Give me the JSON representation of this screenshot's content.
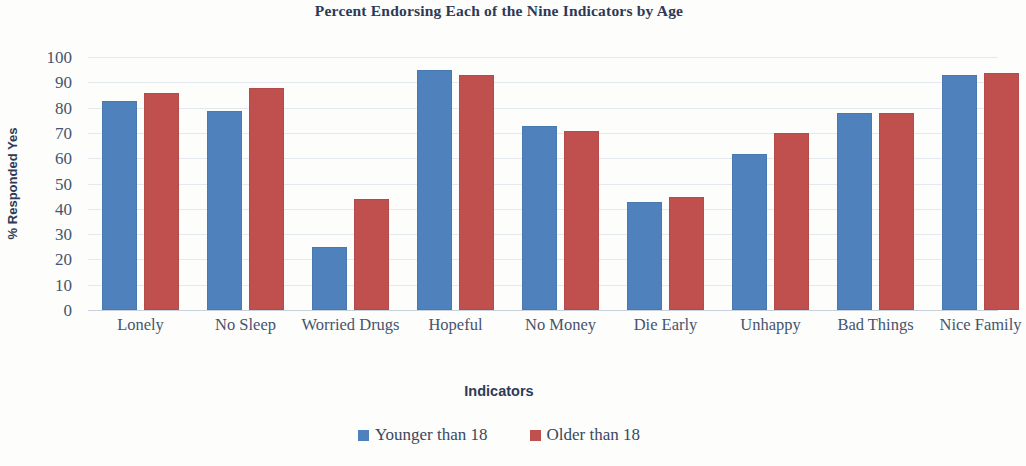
{
  "chart_data": {
    "type": "bar",
    "title": "Percent Endorsing Each of the Nine Indicators by Age",
    "xlabel": "Indicators",
    "ylabel": "% Responded Yes",
    "ylim": [
      0,
      100
    ],
    "ytick_step": 10,
    "yticks": [
      100,
      90,
      80,
      70,
      60,
      50,
      40,
      30,
      20,
      10,
      0
    ],
    "grid": true,
    "legend_position": "bottom",
    "categories": [
      "Lonely",
      "No Sleep",
      "Worried Drugs",
      "Hopeful",
      "No Money",
      "Die Early",
      "Unhappy",
      "Bad Things",
      "Nice Family"
    ],
    "series": [
      {
        "name": "Younger than 18",
        "color": "#4F81BD",
        "values": [
          82,
          78,
          24,
          94,
          72,
          42,
          61,
          77,
          92
        ]
      },
      {
        "name": "Older than 18",
        "color": "#C0504D",
        "values": [
          85,
          87,
          43,
          92,
          70,
          44,
          69,
          77,
          93
        ]
      }
    ],
    "note_rightmost_group_clipped": "Nice Family group extends past the right edge of the image"
  },
  "axis": {
    "y_title": "% Responded Yes",
    "x_title": "Indicators",
    "y_ticks": [
      "100",
      "90",
      "80",
      "70",
      "60",
      "50",
      "40",
      "30",
      "20",
      "10",
      "0"
    ],
    "x_labels": [
      "Lonely",
      "No Sleep",
      "Worried Drugs",
      "Hopeful",
      "No Money",
      "Die Early",
      "Unhappy",
      "Bad Things",
      "Nice Family"
    ]
  },
  "legend": {
    "items": [
      {
        "label": "Younger than 18",
        "color": "#4F81BD"
      },
      {
        "label": "Older than 18",
        "color": "#C0504D"
      }
    ]
  }
}
